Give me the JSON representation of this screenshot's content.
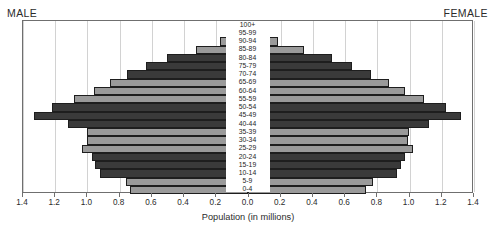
{
  "chart": {
    "title": "",
    "male_label": "MALE",
    "female_label": "FEMALE",
    "axis_title": "Population (in millions)"
  },
  "chart_data": {
    "type": "bar",
    "subtype": "population-pyramid",
    "title": "",
    "xlabel": "Population (in millions)",
    "ylabel": "",
    "orientation": "horizontal",
    "grid": true,
    "legend": false,
    "axis_max": 1.4,
    "xlim": [
      -1.4,
      1.4
    ],
    "left_series_name": "MALE",
    "right_series_name": "FEMALE",
    "left_tick_labels": [
      "1.4",
      "1.2",
      "1.0",
      "0.8",
      "0.6",
      "0.4",
      "0.2",
      "0.0"
    ],
    "right_tick_labels": [
      "0.0",
      "0.2",
      "0.4",
      "0.6",
      "0.8",
      "1.0",
      "1.2",
      "1.4"
    ],
    "tick_values": [
      1.4,
      1.2,
      1.0,
      0.8,
      0.6,
      0.4,
      0.2,
      0.0
    ],
    "categories": [
      "100+",
      "95-99",
      "90-94",
      "85-89",
      "80-84",
      "75-79",
      "70-74",
      "65-69",
      "60-64",
      "55-59",
      "50-54",
      "45-49",
      "40-44",
      "35-39",
      "30-34",
      "25-29",
      "20-24",
      "15-19",
      "10-14",
      "5-9",
      "0-4"
    ],
    "series": [
      {
        "name": "MALE",
        "side": "left",
        "values": [
          0.02,
          0.07,
          0.17,
          0.32,
          0.5,
          0.63,
          0.75,
          0.86,
          0.96,
          1.08,
          1.22,
          1.33,
          1.12,
          1.0,
          1.0,
          1.03,
          0.97,
          0.95,
          0.92,
          0.76,
          0.73
        ]
      },
      {
        "name": "FEMALE",
        "side": "right",
        "values": [
          0.02,
          0.08,
          0.19,
          0.35,
          0.53,
          0.65,
          0.77,
          0.88,
          0.98,
          1.1,
          1.24,
          1.33,
          1.13,
          1.01,
          1.0,
          1.03,
          0.98,
          0.96,
          0.93,
          0.78,
          0.74
        ]
      }
    ],
    "bar_shading": [
      "dark",
      "light",
      "light",
      "light",
      "dark",
      "dark",
      "dark",
      "light",
      "light",
      "light",
      "dark",
      "dark",
      "dark",
      "light",
      "light",
      "light",
      "dark",
      "dark",
      "dark",
      "light",
      "light"
    ],
    "colors": {
      "dark_bar": "#3a3a3a",
      "light_bar": "#9a9a9a",
      "bar_outline": "#1e1e1e",
      "frame": "#6f6f6f",
      "gridline": "#d2d2d2",
      "text": "#2b2b2b",
      "background": "#ffffff"
    }
  }
}
